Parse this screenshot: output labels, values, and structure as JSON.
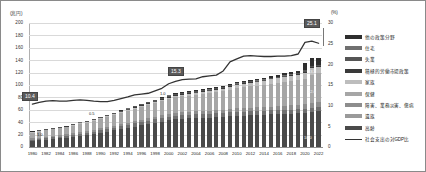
{
  "axes": {
    "left_unit": "(兆円)",
    "right_unit": "(%)",
    "left_ticks": [
      "200",
      "180",
      "160",
      "140",
      "120",
      "100",
      "80",
      "60",
      "40",
      "20",
      "0"
    ],
    "right_ticks": [
      "30",
      "25",
      "20",
      "15",
      "10",
      "5",
      "0"
    ]
  },
  "legend": {
    "items": [
      {
        "label": "他の政策分野",
        "color": "#2e2e2e",
        "type": "bar"
      },
      {
        "label": "住宅",
        "color": "#707070",
        "type": "bar"
      },
      {
        "label": "失業",
        "color": "#555555",
        "type": "bar"
      },
      {
        "label": "積極的労働市場政策",
        "color": "#3a3a3a",
        "type": "bar"
      },
      {
        "label": "家族",
        "color": "#bdbdbd",
        "type": "bar"
      },
      {
        "label": "保健",
        "color": "#a6a6a6",
        "type": "bar"
      },
      {
        "label": "障害、業務災害、傷病",
        "color": "#8d8d8d",
        "type": "bar"
      },
      {
        "label": "遺族",
        "color": "#9a9a9a",
        "type": "bar"
      },
      {
        "label": "高齢",
        "color": "#4a4a4a",
        "type": "bar"
      },
      {
        "label": "社会支出の対GDP比",
        "color": "#333333",
        "type": "line"
      }
    ]
  },
  "callouts": [
    {
      "text": "10.4",
      "x": 21,
      "y": 91
    },
    {
      "text": "15.3",
      "x": 167,
      "y": 66
    },
    {
      "text": "25.1",
      "x": 303,
      "y": 18
    }
  ],
  "inline_values": [
    {
      "text": "0.5",
      "x": 88,
      "y": 110,
      "light": false
    },
    {
      "text": "1.0",
      "x": 159,
      "y": 90,
      "light": false
    },
    {
      "text": "1.0",
      "x": 36,
      "y": 131,
      "light": false
    },
    {
      "text": "13.2",
      "x": 307,
      "y": 68,
      "light": true
    },
    {
      "text": "12.0",
      "x": 307,
      "y": 88,
      "light": true
    },
    {
      "text": "10.0",
      "x": 303,
      "y": 134,
      "light": true
    }
  ],
  "chart_data": {
    "type": "bar",
    "title": "",
    "xlabel": "",
    "ylabel": "兆円",
    "y2label": "%",
    "ylim": [
      0,
      200
    ],
    "y2lim": [
      0,
      30
    ],
    "grid": true,
    "legend_position": "right",
    "categories": [
      "1980",
      "1981",
      "1982",
      "1983",
      "1984",
      "1985",
      "1986",
      "1987",
      "1988",
      "1989",
      "1990",
      "1991",
      "1992",
      "1993",
      "1994",
      "1995",
      "1996",
      "1997",
      "1998",
      "1999",
      "2000",
      "2001",
      "2002",
      "2003",
      "2004",
      "2005",
      "2006",
      "2007",
      "2008",
      "2009",
      "2010",
      "2011",
      "2012",
      "2013",
      "2014",
      "2015",
      "2016",
      "2017",
      "2018",
      "2019",
      "2020",
      "2021",
      "2022"
    ],
    "x_tick_labels": [
      "1980",
      "1982",
      "1984",
      "1986",
      "1988",
      "1990",
      "1992",
      "1994",
      "1996",
      "1998",
      "2000",
      "2002",
      "2004",
      "2006",
      "2008",
      "2010",
      "2012",
      "2014",
      "2016",
      "2018",
      "2020",
      "2022"
    ],
    "series": [
      {
        "name": "高齢",
        "values": [
          10.0,
          11.0,
          12.0,
          13.0,
          14.0,
          15.0,
          16.5,
          18.0,
          19.5,
          21.0,
          23.0,
          25.0,
          27.0,
          29.0,
          31.0,
          33.0,
          35.0,
          37.0,
          39.0,
          41.0,
          43.0,
          44.5,
          45.5,
          46.0,
          46.5,
          47.0,
          47.5,
          48.0,
          48.5,
          49.5,
          50.0,
          50.5,
          51.0,
          51.5,
          52.0,
          52.5,
          53.0,
          53.5,
          54.0,
          54.5,
          55.5,
          57.0,
          58.0
        ]
      },
      {
        "name": "遺族",
        "values": [
          2.0,
          2.2,
          2.4,
          2.6,
          2.8,
          3.0,
          3.2,
          3.4,
          3.6,
          3.8,
          4.0,
          4.2,
          4.4,
          4.6,
          4.8,
          5.0,
          5.2,
          5.4,
          5.6,
          5.8,
          6.0,
          6.1,
          6.2,
          6.3,
          6.4,
          6.5,
          6.5,
          6.6,
          6.6,
          6.7,
          6.7,
          6.7,
          6.7,
          6.6,
          6.6,
          6.5,
          6.5,
          6.4,
          6.4,
          6.3,
          6.3,
          6.2,
          6.2
        ]
      },
      {
        "name": "障害、業務災害、傷病",
        "values": [
          2.0,
          2.1,
          2.2,
          2.3,
          2.4,
          2.5,
          2.6,
          2.7,
          2.8,
          2.9,
          3.0,
          3.1,
          3.3,
          3.5,
          3.6,
          3.8,
          3.9,
          4.0,
          4.1,
          4.2,
          4.3,
          4.4,
          4.5,
          4.6,
          4.7,
          4.8,
          4.9,
          5.0,
          5.1,
          5.3,
          5.5,
          5.6,
          5.8,
          5.9,
          6.1,
          6.3,
          6.5,
          6.7,
          6.9,
          7.1,
          7.4,
          7.7,
          7.9
        ]
      },
      {
        "name": "保健",
        "values": [
          9.0,
          9.6,
          10.2,
          10.6,
          11.0,
          11.5,
          12.2,
          13.0,
          13.6,
          14.2,
          15.0,
          16.0,
          17.0,
          18.0,
          19.0,
          20.0,
          21.0,
          21.5,
          22.0,
          23.0,
          24.0,
          25.0,
          25.5,
          26.0,
          26.5,
          27.5,
          28.0,
          29.0,
          30.0,
          31.0,
          32.5,
          33.5,
          34.5,
          35.0,
          35.5,
          37.0,
          37.5,
          38.5,
          39.0,
          40.0,
          41.0,
          46.0,
          46.5
        ]
      },
      {
        "name": "家族",
        "values": [
          0.8,
          0.8,
          0.9,
          0.9,
          0.9,
          1.0,
          1.0,
          1.0,
          1.1,
          1.1,
          1.2,
          1.3,
          1.4,
          1.5,
          1.6,
          1.7,
          1.8,
          1.9,
          2.0,
          2.2,
          2.5,
          2.7,
          2.8,
          3.0,
          3.2,
          3.4,
          3.6,
          3.8,
          4.0,
          4.5,
          5.0,
          5.5,
          5.8,
          6.0,
          6.4,
          7.0,
          7.5,
          8.0,
          8.5,
          9.0,
          10.0,
          10.5,
          11.0
        ]
      },
      {
        "name": "積極的労働市場政策",
        "values": [
          0.3,
          0.3,
          0.3,
          0.3,
          0.3,
          0.3,
          0.3,
          0.4,
          0.4,
          0.4,
          0.4,
          0.4,
          0.5,
          0.5,
          0.5,
          0.6,
          0.6,
          0.6,
          0.6,
          0.7,
          0.7,
          0.7,
          0.7,
          0.7,
          0.6,
          0.6,
          0.6,
          0.6,
          0.6,
          0.8,
          0.8,
          0.8,
          0.7,
          0.7,
          0.7,
          0.7,
          0.7,
          0.7,
          0.7,
          0.7,
          1.0,
          1.0,
          0.9
        ]
      },
      {
        "name": "失業",
        "values": [
          0.9,
          0.9,
          1.0,
          1.0,
          1.0,
          1.0,
          1.1,
          1.1,
          1.1,
          1.1,
          1.1,
          1.1,
          1.2,
          1.4,
          1.6,
          1.8,
          1.9,
          1.9,
          2.0,
          2.3,
          2.5,
          2.5,
          2.4,
          2.2,
          1.9,
          1.7,
          1.6,
          1.5,
          1.5,
          2.0,
          2.0,
          1.8,
          1.5,
          1.4,
          1.3,
          1.2,
          1.2,
          1.2,
          1.2,
          1.2,
          2.5,
          2.0,
          1.5
        ]
      },
      {
        "name": "住宅",
        "values": [
          0.1,
          0.1,
          0.1,
          0.1,
          0.1,
          0.1,
          0.1,
          0.1,
          0.1,
          0.1,
          0.1,
          0.1,
          0.2,
          0.2,
          0.2,
          0.2,
          0.2,
          0.2,
          0.2,
          0.3,
          0.3,
          0.3,
          0.3,
          0.4,
          0.4,
          0.4,
          0.4,
          0.5,
          0.5,
          0.5,
          0.5,
          0.6,
          0.6,
          0.6,
          0.6,
          0.6,
          0.6,
          0.6,
          0.6,
          0.6,
          0.6,
          0.6,
          0.6
        ]
      },
      {
        "name": "他の政策分野",
        "values": [
          0.4,
          0.4,
          0.4,
          0.4,
          0.4,
          0.4,
          0.4,
          0.4,
          0.5,
          0.5,
          0.5,
          0.5,
          0.5,
          0.6,
          0.6,
          0.6,
          0.7,
          0.7,
          0.8,
          0.9,
          1.0,
          1.1,
          1.2,
          1.3,
          1.4,
          1.5,
          1.6,
          1.7,
          1.8,
          2.0,
          2.2,
          2.3,
          2.4,
          2.5,
          2.6,
          2.8,
          3.0,
          3.2,
          3.4,
          3.6,
          12.0,
          13.0,
          11.0
        ]
      }
    ],
    "line_series": {
      "name": "社会支出の対GDP比",
      "unit": "%",
      "axis": "right",
      "values": [
        10.4,
        10.8,
        11.1,
        11.2,
        11.1,
        11.1,
        11.3,
        11.4,
        11.3,
        11.1,
        11.0,
        11.0,
        11.3,
        11.7,
        12.1,
        12.6,
        12.8,
        13.0,
        13.6,
        14.2,
        15.3,
        15.9,
        16.3,
        16.4,
        16.5,
        17.0,
        17.2,
        17.4,
        18.4,
        20.6,
        21.3,
        22.0,
        22.1,
        22.0,
        21.9,
        21.9,
        22.0,
        22.0,
        22.1,
        22.5,
        25.3,
        25.6,
        25.1
      ]
    }
  }
}
